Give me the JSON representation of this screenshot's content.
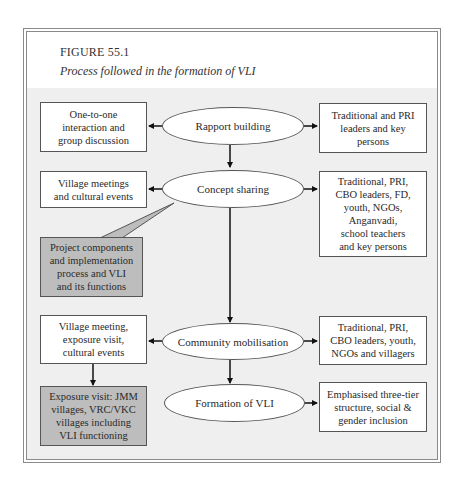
{
  "figure": {
    "number": "FIGURE 55.1",
    "title": "Process followed in the formation of VLI"
  },
  "colors": {
    "panel_bg": "#efefef",
    "box_bg": "#ffffff",
    "shaded_box_bg": "#bdbdbd",
    "stroke": "#555555"
  },
  "stages": [
    {
      "id": "rapport",
      "label": "Rapport building"
    },
    {
      "id": "concept",
      "label": "Concept sharing"
    },
    {
      "id": "mobilisation",
      "label": "Community mobilisation"
    },
    {
      "id": "formation",
      "label": "Formation of VLI"
    }
  ],
  "left_boxes": [
    {
      "id": "one-to-one",
      "label": "One-to-one\ninteraction and\ngroup discussion"
    },
    {
      "id": "village-meetings",
      "label": "Village meetings\nand cultural events"
    },
    {
      "id": "project-components",
      "label": "Project components\nand implementation\nprocess and VLI\nand its functions",
      "shaded": true
    },
    {
      "id": "village-meeting-exposure",
      "label": "Village meeting,\nexposure visit,\ncultural events"
    },
    {
      "id": "exposure-visit",
      "label": "Exposure visit: JMM\nvillages, VRC/VKC\nvillages including\nVLI functioning",
      "shaded": true
    }
  ],
  "right_boxes": [
    {
      "id": "rapport-participants",
      "label": "Traditional and PRI\nleaders and key\npersons"
    },
    {
      "id": "concept-participants",
      "label": "Traditional, PRI,\nCBO leaders, FD,\nyouth, NGOs,\nAnganvadi,\nschool teachers\nand key persons"
    },
    {
      "id": "mobilisation-participants",
      "label": "Traditional, PRI,\nCBO leaders, youth,\nNGOs and villagers"
    },
    {
      "id": "formation-emphasis",
      "label": "Emphasised three-tier\nstructure, social &\ngender inclusion"
    }
  ]
}
